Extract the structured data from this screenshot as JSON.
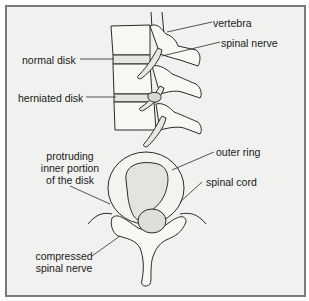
{
  "diagram": {
    "colors": {
      "background": "#f1f1ef",
      "border": "#7a7a7a",
      "line": "#2a2a2a",
      "bone_fill": "#f7f7f4",
      "shade": "#cfcfca"
    },
    "side_view": {
      "labels": {
        "vertebra": "vertebra",
        "spinal_nerve": "spinal nerve",
        "normal_disk": "normal disk",
        "herniated_disk": "herniated disk"
      }
    },
    "top_view": {
      "labels": {
        "outer_ring": "outer ring",
        "spinal_cord": "spinal cord",
        "protruding_line1": "protruding",
        "protruding_line2": "inner portion",
        "protruding_line3": "of the disk",
        "compressed_line1": "compressed",
        "compressed_line2": "spinal nerve"
      }
    }
  }
}
